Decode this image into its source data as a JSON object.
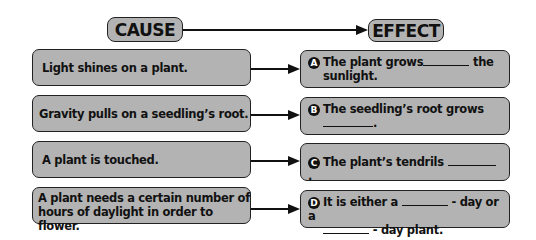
{
  "headers": {
    "cause": "CAUSE",
    "effect": "EFFECT"
  },
  "rows": [
    {
      "cause": "Light shines on a plant.",
      "effect": {
        "letter": "A",
        "line1_pre": "The plant grows",
        "line1_post": "the",
        "line2": "sunlight."
      }
    },
    {
      "cause": "Gravity pulls on a seedling’s root.",
      "effect": {
        "letter": "B",
        "line1": "The seedling’s root grows",
        "line2_post": "."
      }
    },
    {
      "cause": "A plant is touched.",
      "effect": {
        "letter": "C",
        "line1_pre": "The plant’s tendrils",
        "line1_post": "."
      }
    },
    {
      "cause_line1": "A plant needs a certain number of",
      "cause_line2": "hours of daylight in order to flower.",
      "effect": {
        "letter": "D",
        "line1_pre": "It is either a",
        "line1_post": "- day or a",
        "line2_post": "- day plant."
      }
    }
  ],
  "colors": {
    "box_fill": "#b3b3b3",
    "border": "#222222",
    "text": "#111111"
  }
}
